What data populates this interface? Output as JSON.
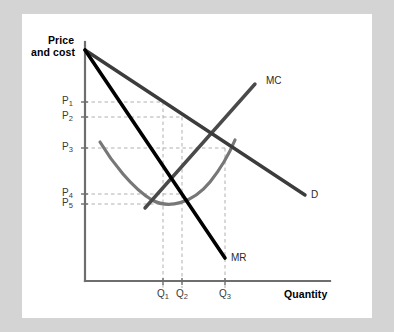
{
  "figure": {
    "type": "economics-diagram",
    "axis_titles": {
      "y_line1": "Price",
      "y_line2": "and cost",
      "x": "Quantity"
    },
    "curve_labels": {
      "mc": "MC",
      "demand": "D",
      "marginal_revenue": "MR"
    },
    "price_ticks": [
      {
        "id": "P1",
        "base": "P",
        "sub": "1"
      },
      {
        "id": "P2",
        "base": "P",
        "sub": "2"
      },
      {
        "id": "P3",
        "base": "P",
        "sub": "3"
      },
      {
        "id": "P4",
        "base": "P",
        "sub": "4"
      },
      {
        "id": "P5",
        "base": "P",
        "sub": "5"
      }
    ],
    "quantity_ticks": [
      {
        "id": "Q1",
        "base": "Q",
        "sub": "1"
      },
      {
        "id": "Q2",
        "base": "Q",
        "sub": "2"
      },
      {
        "id": "Q3",
        "base": "Q",
        "sub": "3"
      }
    ],
    "colors": {
      "background": "#d4d4d4",
      "card": "#ffffff",
      "axis": "#6e6e6e",
      "demand_curve": "#3c3c3c",
      "mc_curve": "#4a4a4a",
      "atc_curve": "#777777",
      "mr_curve": "#000000",
      "guide_dashed": "#b0b0b0",
      "text": "#000000"
    }
  },
  "chart_data": {
    "type": "line",
    "title": "",
    "xlabel": "Quantity",
    "ylabel": "Price and cost",
    "grid": false,
    "legend": "inline-curve-labels",
    "xlim": [
      0,
      245
    ],
    "ylim": [
      0,
      239
    ],
    "axis_origin_px": {
      "x": 85,
      "y": 281
    },
    "x_tick_values": [
      {
        "label": "Q1",
        "px": 163
      },
      {
        "label": "Q2",
        "px": 182
      },
      {
        "label": "Q3",
        "px": 225
      }
    ],
    "y_tick_values": [
      {
        "label": "P1",
        "px": 102
      },
      {
        "label": "P2",
        "px": 117
      },
      {
        "label": "P3",
        "px": 148
      },
      {
        "label": "P4",
        "px": 194
      },
      {
        "label": "P5",
        "px": 204
      }
    ],
    "series": [
      {
        "name": "D",
        "kind": "straight-line",
        "color": "#3c3c3c",
        "width": 3.4,
        "points_px": [
          [
            85,
            50
          ],
          [
            305,
            195
          ]
        ]
      },
      {
        "name": "MR",
        "kind": "straight-line",
        "color": "#000000",
        "width": 3.6,
        "points_px": [
          [
            85,
            50
          ],
          [
            225,
            258
          ]
        ]
      },
      {
        "name": "MC",
        "kind": "straight-line",
        "color": "#4a4a4a",
        "width": 3.4,
        "points_px": [
          [
            145,
            208
          ],
          [
            255,
            84
          ]
        ]
      },
      {
        "name": "ATC",
        "kind": "u-shaped-curve",
        "color": "#777777",
        "width": 3.2,
        "points_px": [
          [
            100,
            142
          ],
          [
            120,
            172
          ],
          [
            145,
            194
          ],
          [
            165,
            204
          ],
          [
            190,
            198
          ],
          [
            212,
            176
          ],
          [
            235,
            140
          ]
        ]
      }
    ],
    "guides": [
      {
        "orientation": "horizontal",
        "from_px": [
          85,
          102
        ],
        "to_px": [
          163,
          102
        ],
        "tick": "P1"
      },
      {
        "orientation": "horizontal",
        "from_px": [
          85,
          117
        ],
        "to_px": [
          182,
          117
        ],
        "tick": "P2"
      },
      {
        "orientation": "horizontal",
        "from_px": [
          85,
          148
        ],
        "to_px": [
          225,
          148
        ],
        "tick": "P3"
      },
      {
        "orientation": "horizontal",
        "from_px": [
          85,
          194
        ],
        "to_px": [
          182,
          194
        ],
        "tick": "P4"
      },
      {
        "orientation": "horizontal",
        "from_px": [
          85,
          204
        ],
        "to_px": [
          163,
          204
        ],
        "tick": "P5"
      },
      {
        "orientation": "vertical",
        "from_px": [
          163,
          102
        ],
        "to_px": [
          163,
          288
        ],
        "tick": "Q1"
      },
      {
        "orientation": "vertical",
        "from_px": [
          182,
          117
        ],
        "to_px": [
          182,
          288
        ],
        "tick": "Q2"
      },
      {
        "orientation": "vertical",
        "from_px": [
          225,
          148
        ],
        "to_px": [
          225,
          288
        ],
        "tick": "Q3"
      }
    ]
  }
}
